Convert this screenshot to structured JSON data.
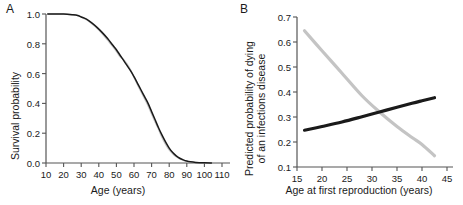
{
  "figure": {
    "panels": [
      {
        "letter": "A",
        "xlabel": "Age (years)",
        "ylabel": "Survival probability"
      },
      {
        "letter": "B",
        "xlabel": "Age at first reproduction (years)",
        "ylabel_line1": "Predicted probability of dying",
        "ylabel_line2": "of an infections disease"
      }
    ]
  },
  "colors": {
    "black_series": "#1a1a1a",
    "gray_series": "#c4c4c4",
    "axis": "#555555",
    "text": "#1a1a1a"
  },
  "chart_data": [
    {
      "type": "line",
      "panel": "A",
      "title": "",
      "xlabel": "Age (years)",
      "ylabel": "Survival probability",
      "xlim": [
        10,
        110
      ],
      "ylim": [
        0.0,
        1.0
      ],
      "xticks": [
        10,
        20,
        30,
        40,
        50,
        60,
        70,
        80,
        90,
        100,
        110
      ],
      "xticklabels": [
        "10",
        "20",
        "30",
        "40",
        "50",
        "60",
        "70",
        "80",
        "90",
        "100",
        "110"
      ],
      "yticks": [
        0.0,
        0.2,
        0.4,
        0.6,
        0.8,
        1.0
      ],
      "yticklabels": [
        "0.0",
        "0.2",
        "0.4",
        "0.6",
        "0.8",
        "1.0"
      ],
      "grid": false,
      "legend": "none",
      "series": [
        {
          "name": "black curve",
          "color": "#1a1a1a",
          "x": [
            11,
            15,
            20,
            25,
            28,
            30,
            33,
            36,
            39,
            42,
            45,
            48,
            50,
            52,
            54,
            56,
            58,
            60,
            62,
            64,
            66,
            68,
            70,
            72,
            74,
            76,
            78,
            80,
            82,
            84,
            86,
            88,
            90,
            92,
            95,
            100,
            104
          ],
          "y": [
            1.0,
            1.0,
            1.0,
            0.995,
            0.99,
            0.98,
            0.965,
            0.94,
            0.91,
            0.875,
            0.835,
            0.79,
            0.76,
            0.725,
            0.69,
            0.655,
            0.62,
            0.58,
            0.535,
            0.49,
            0.445,
            0.4,
            0.345,
            0.29,
            0.235,
            0.185,
            0.14,
            0.1,
            0.07,
            0.048,
            0.032,
            0.021,
            0.013,
            0.008,
            0.004,
            0.001,
            0.0
          ]
        },
        {
          "name": "gray curve",
          "color": "#c4c4c4",
          "x": [
            11,
            15,
            20,
            25,
            28,
            30,
            33,
            36,
            39,
            42,
            45,
            48,
            50,
            52,
            54,
            56,
            58,
            60,
            62,
            64,
            66,
            68,
            70,
            72,
            74,
            76,
            78,
            80,
            82,
            84,
            86,
            88,
            90,
            92,
            95,
            100,
            104
          ],
          "y": [
            1.0,
            1.0,
            1.0,
            0.995,
            0.99,
            0.98,
            0.962,
            0.935,
            0.905,
            0.868,
            0.825,
            0.782,
            0.75,
            0.715,
            0.695,
            0.665,
            0.625,
            0.575,
            0.525,
            0.478,
            0.432,
            0.385,
            0.33,
            0.275,
            0.225,
            0.17,
            0.125,
            0.088,
            0.062,
            0.042,
            0.028,
            0.018,
            0.011,
            0.006,
            0.003,
            0.001,
            0.0
          ]
        }
      ]
    },
    {
      "type": "line",
      "panel": "B",
      "title": "",
      "xlabel": "Age at first reproduction (years)",
      "ylabel": "Predicted probability of dying of an infections disease",
      "xlim": [
        15,
        45
      ],
      "ylim": [
        0.1,
        0.7
      ],
      "xticks": [
        15,
        20,
        25,
        30,
        35,
        40,
        45
      ],
      "xticklabels": [
        "15",
        "20",
        "25",
        "30",
        "35",
        "40",
        "45"
      ],
      "yticks": [
        0.1,
        0.2,
        0.3,
        0.4,
        0.5,
        0.6,
        0.7
      ],
      "yticklabels": [
        "0.1",
        "0.2",
        "0.3",
        "0.4",
        "0.5",
        "0.6",
        "0.7"
      ],
      "grid": false,
      "legend": "none",
      "crossing_point": {
        "x": 31.5,
        "y": 0.32
      },
      "series": [
        {
          "name": "gray decreasing curve",
          "color": "#c4c4c4",
          "x": [
            16.5,
            20,
            24,
            28,
            31.5,
            35,
            38,
            40,
            42.5
          ],
          "y": [
            0.645,
            0.565,
            0.475,
            0.385,
            0.32,
            0.262,
            0.218,
            0.19,
            0.145
          ]
        },
        {
          "name": "black increasing curve",
          "color": "#1a1a1a",
          "x": [
            16.5,
            20,
            24,
            28,
            31.5,
            35,
            38,
            40,
            42.5
          ],
          "y": [
            0.247,
            0.262,
            0.28,
            0.301,
            0.32,
            0.339,
            0.355,
            0.365,
            0.377
          ]
        }
      ]
    }
  ]
}
